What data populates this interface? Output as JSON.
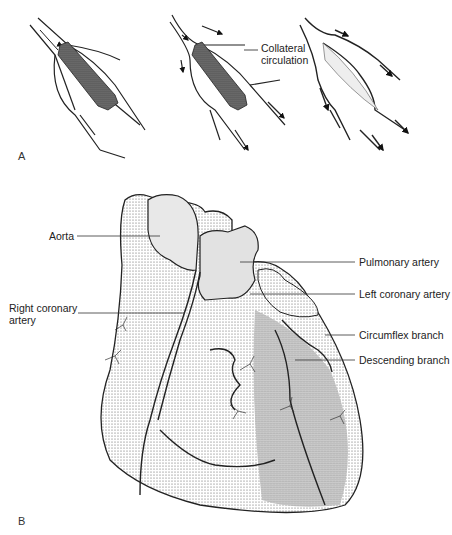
{
  "panel_a": {
    "letter": "A",
    "labels": {
      "collateral_line1": "Collateral",
      "collateral_line2": "circulation"
    }
  },
  "panel_b": {
    "letter": "B",
    "labels": {
      "aorta": "Aorta",
      "pulmonary_artery": "Pulmonary artery",
      "left_coronary_artery": "Left coronary artery",
      "right_coronary_line1": "Right coronary",
      "right_coronary_line2": "artery",
      "circumflex_branch": "Circumflex branch",
      "descending_branch": "Descending branch"
    }
  },
  "colors": {
    "ink": "#222222",
    "shade_light": "#e6e6e6",
    "shade_dark": "#b8b8b8",
    "background": "#ffffff"
  }
}
